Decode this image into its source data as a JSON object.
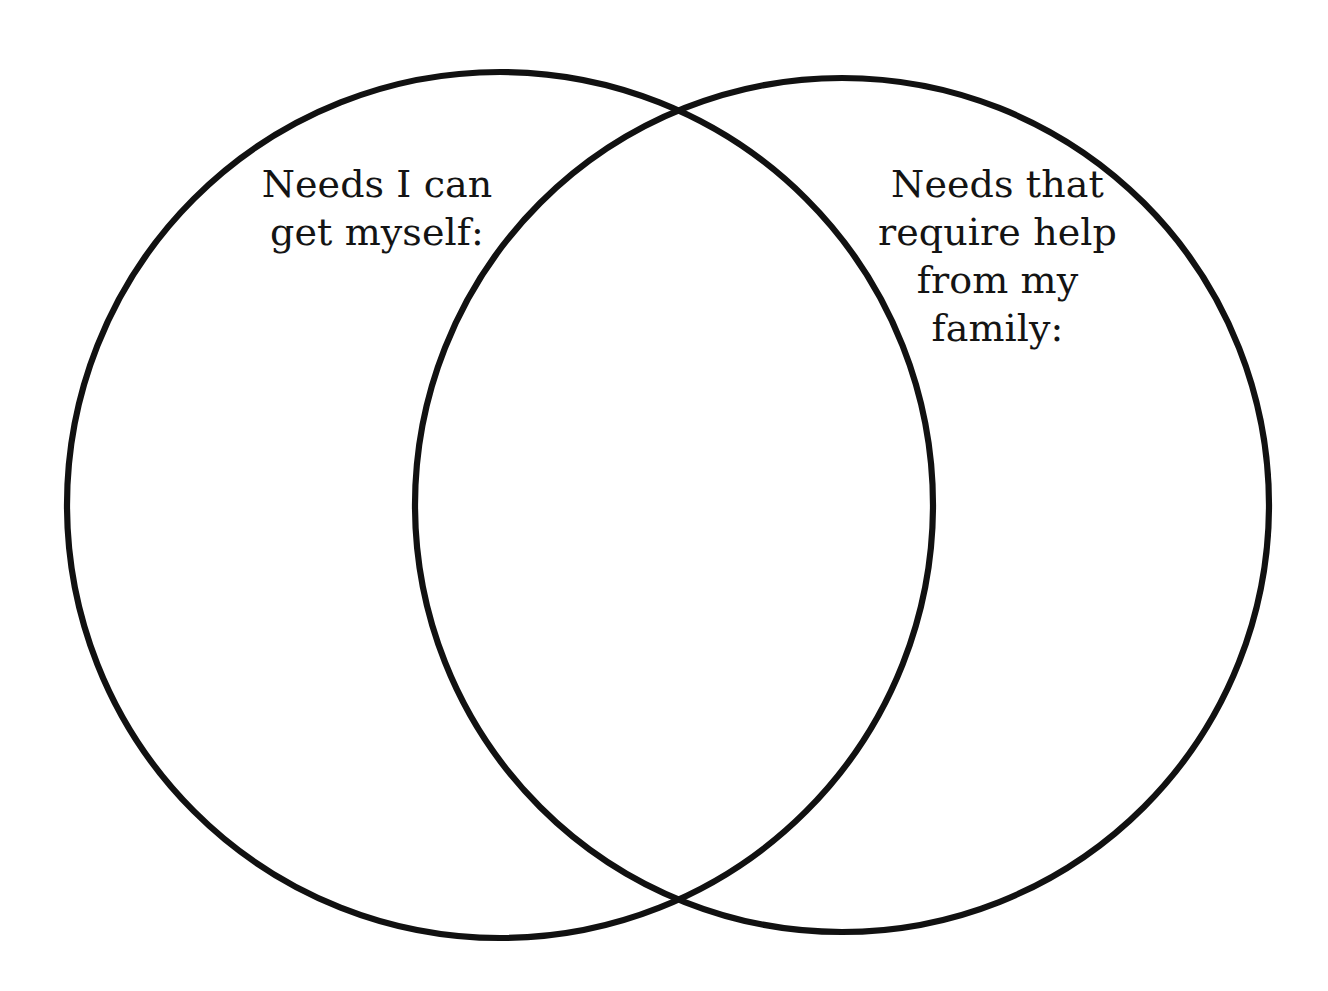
{
  "diagram": {
    "type": "venn-two-circle",
    "background_color": "#ffffff",
    "stroke_color": "#111111",
    "text_color": "#141414",
    "left_circle": {
      "name": "left-circle",
      "label": "Needs I can\nget myself:",
      "label_lines": [
        "Needs I can",
        "get myself:"
      ],
      "center_x": 500,
      "center_y": 505,
      "radius": 433
    },
    "right_circle": {
      "name": "right-circle",
      "label": "Needs that\nrequire help\nfrom my\nfamily:",
      "label_lines": [
        "Needs that",
        "require help",
        "from my",
        "family:"
      ],
      "center_x": 842,
      "center_y": 505,
      "radius": 427
    },
    "overlap_region": {
      "name": "intersection-region",
      "label": "",
      "top_intersection_x": 675,
      "top_intersection_y": 105,
      "bottom_intersection_x": 675,
      "bottom_intersection_y": 910
    }
  }
}
